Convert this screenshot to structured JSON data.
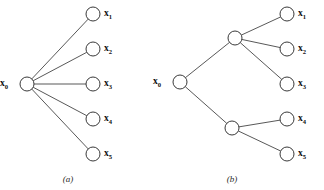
{
  "figure": {
    "background_color": "#ffffff",
    "node_stroke_color": "#2e2e2e",
    "edge_stroke_color": "#3a3a3a",
    "node_fill_color": "#ffffff",
    "label_color": "#111111",
    "node_radius": 7
  },
  "panels": [
    {
      "id": "a",
      "caption": "(a)",
      "caption_x": 68,
      "caption_y": 180,
      "topology": "star",
      "root": {
        "id": "x0",
        "base": "x",
        "subscript": "0",
        "cx": 27,
        "cy": 84,
        "label_x": 8,
        "label_y": 84
      },
      "leaves": [
        {
          "id": "x1",
          "base": "x",
          "subscript": "1",
          "cx": 93,
          "cy": 14,
          "label_x": 104,
          "label_y": 14
        },
        {
          "id": "x2",
          "base": "x",
          "subscript": "2",
          "cx": 93,
          "cy": 49,
          "label_x": 104,
          "label_y": 49
        },
        {
          "id": "x3",
          "base": "x",
          "subscript": "3",
          "cx": 93,
          "cy": 84,
          "label_x": 104,
          "label_y": 84
        },
        {
          "id": "x4",
          "base": "x",
          "subscript": "4",
          "cx": 93,
          "cy": 119,
          "label_x": 104,
          "label_y": 119
        },
        {
          "id": "x5",
          "base": "x",
          "subscript": "5",
          "cx": 93,
          "cy": 154,
          "label_x": 104,
          "label_y": 154
        }
      ],
      "internal_nodes": [],
      "edges": [
        {
          "from": "x0",
          "to": "x1"
        },
        {
          "from": "x0",
          "to": "x2"
        },
        {
          "from": "x0",
          "to": "x3"
        },
        {
          "from": "x0",
          "to": "x4"
        },
        {
          "from": "x0",
          "to": "x5"
        }
      ]
    },
    {
      "id": "b",
      "caption": "(b)",
      "caption_x": 232,
      "caption_y": 180,
      "topology": "tree",
      "root": {
        "id": "x0",
        "base": "x",
        "subscript": "0",
        "cx": 180,
        "cy": 82,
        "label_x": 161,
        "label_y": 82
      },
      "leaves": [
        {
          "id": "x1",
          "base": "x",
          "subscript": "1",
          "cx": 287,
          "cy": 14,
          "label_x": 298,
          "label_y": 14
        },
        {
          "id": "x2",
          "base": "x",
          "subscript": "2",
          "cx": 287,
          "cy": 49,
          "label_x": 298,
          "label_y": 49
        },
        {
          "id": "x3",
          "base": "x",
          "subscript": "3",
          "cx": 287,
          "cy": 84,
          "label_x": 298,
          "label_y": 84
        },
        {
          "id": "x4",
          "base": "x",
          "subscript": "4",
          "cx": 287,
          "cy": 119,
          "label_x": 298,
          "label_y": 119
        },
        {
          "id": "x5",
          "base": "x",
          "subscript": "5",
          "cx": 287,
          "cy": 154,
          "label_x": 298,
          "label_y": 154
        }
      ],
      "internal_nodes": [
        {
          "id": "n_upper",
          "cx": 235,
          "cy": 38
        },
        {
          "id": "n_lower",
          "cx": 232,
          "cy": 128
        }
      ],
      "edges": [
        {
          "from": "x0",
          "to": "n_upper"
        },
        {
          "from": "x0",
          "to": "n_lower"
        },
        {
          "from": "n_upper",
          "to": "x1"
        },
        {
          "from": "n_upper",
          "to": "x2"
        },
        {
          "from": "n_upper",
          "to": "x3"
        },
        {
          "from": "n_lower",
          "to": "x4"
        },
        {
          "from": "n_lower",
          "to": "x5"
        }
      ]
    }
  ]
}
